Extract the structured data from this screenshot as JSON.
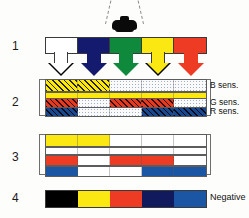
{
  "figure": {
    "light_source": {
      "name": "lamp",
      "color": "#000000"
    },
    "row_numbers": {
      "one": "1",
      "two": "2",
      "three": "3",
      "four": "4"
    },
    "labels": {
      "b_sens": "B sens.",
      "g_sens": "G sens.",
      "r_sens": "R sens.",
      "negative": "Negative"
    },
    "rows": [
      {
        "id": "row1",
        "number": "1",
        "name": "subject-colors",
        "segments": [
          {
            "name": "white",
            "fill": "f-white",
            "color": "#ffffff"
          },
          {
            "name": "blue",
            "fill": "f-navy",
            "color": "#141a6e"
          },
          {
            "name": "green",
            "fill": "f-green",
            "color": "#0f8a3c"
          },
          {
            "name": "yellow",
            "fill": "f-yellow",
            "color": "#fbe711"
          },
          {
            "name": "red",
            "fill": "f-red",
            "color": "#ee3b24"
          }
        ],
        "arrows": [
          {
            "name": "arrow-white",
            "fill": "#ffffff"
          },
          {
            "name": "arrow-blue",
            "fill": "#141a6e"
          },
          {
            "name": "arrow-green",
            "fill": "#0f8a3c"
          },
          {
            "name": "arrow-yellow",
            "fill": "#fbe711"
          },
          {
            "name": "arrow-red",
            "fill": "#ee3b24"
          }
        ]
      },
      {
        "id": "row2",
        "number": "2",
        "name": "exposed-emulsion-layers",
        "layers": [
          {
            "name": "blue-sensitive-layer",
            "label": "B sens.",
            "segments": [
              "f-hy",
              "f-hy",
              "f-dot",
              "f-dot",
              "f-dot"
            ]
          },
          {
            "name": "yellow-filter-layer",
            "label": "",
            "segments": [
              "f-solidyel",
              "f-solidyel",
              "f-solidyel",
              "f-solidyel",
              "f-solidyel"
            ]
          },
          {
            "name": "green-sensitive-layer",
            "label": "G sens.",
            "segments": [
              "f-hr",
              "f-dot",
              "f-hr",
              "f-hr",
              "f-dot"
            ]
          },
          {
            "name": "red-sensitive-layer",
            "label": "R sens.",
            "segments": [
              "f-hb",
              "f-dot",
              "f-dot",
              "f-hb",
              "f-hb"
            ]
          }
        ]
      },
      {
        "id": "row3",
        "number": "3",
        "name": "developed-dye-layers",
        "layers": [
          {
            "name": "yellow-dye-layer",
            "segments": [
              "f-yellow",
              "f-yellow",
              "f-white",
              "f-white",
              "f-white"
            ]
          },
          {
            "name": "clear-layer",
            "segments": [
              "f-white",
              "f-white",
              "f-white",
              "f-white",
              "f-white"
            ]
          },
          {
            "name": "magenta-dye-layer",
            "segments": [
              "f-red",
              "f-white",
              "f-red",
              "f-red",
              "f-white"
            ]
          },
          {
            "name": "cyan-dye-layer",
            "segments": [
              "f-blue",
              "f-white",
              "f-white",
              "f-blue",
              "f-blue"
            ]
          }
        ]
      },
      {
        "id": "row4",
        "number": "4",
        "name": "resulting-negative",
        "label": "Negative",
        "segments": [
          {
            "name": "black",
            "fill": "f-black",
            "color": "#000000"
          },
          {
            "name": "yellow",
            "fill": "f-yellow",
            "color": "#fbe711"
          },
          {
            "name": "red",
            "fill": "f-red",
            "color": "#ee3b24"
          },
          {
            "name": "dark-blue",
            "fill": "f-dnavy",
            "color": "#121a5e"
          },
          {
            "name": "blue",
            "fill": "f-blue",
            "color": "#1b56a4"
          }
        ]
      }
    ]
  }
}
